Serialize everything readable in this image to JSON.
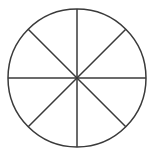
{
  "figure": {
    "name": "circle-divided-into-eighths",
    "type": "fraction-circle-diagram",
    "background_color": "#ffffff",
    "stroke_color": "#3a3a3a",
    "fill_color": "#ffffff",
    "stroke_width": 1.5,
    "total_sectors": 8,
    "shaded_sectors": 0,
    "unshaded_sectors": 8
  },
  "chart_data": {
    "type": "pie",
    "title": "",
    "xlabel": "",
    "ylabel": "",
    "legend_position": "none",
    "grid": false,
    "categories": [
      "Sector 1",
      "Sector 2",
      "Sector 3",
      "Sector 4",
      "Sector 5",
      "Sector 6",
      "Sector 7",
      "Sector 8"
    ],
    "values": [
      12.5,
      12.5,
      12.5,
      12.5,
      12.5,
      12.5,
      12.5,
      12.5
    ],
    "slice_fraction": "1/8",
    "slice_angle_degrees": 45,
    "colors": [
      "#ffffff",
      "#ffffff",
      "#ffffff",
      "#ffffff",
      "#ffffff",
      "#ffffff",
      "#ffffff",
      "#ffffff"
    ],
    "annotations": []
  },
  "geometry": {
    "center_x": 77,
    "center_y": 78,
    "radius": 69,
    "diameters": [
      {
        "name": "vertical-diameter",
        "angle_degrees": 90
      },
      {
        "name": "horizontal-diameter",
        "angle_degrees": 0
      },
      {
        "name": "diagonal-diameter-nw-se",
        "angle_degrees": 135
      },
      {
        "name": "diagonal-diameter-ne-sw",
        "angle_degrees": 45
      }
    ]
  }
}
